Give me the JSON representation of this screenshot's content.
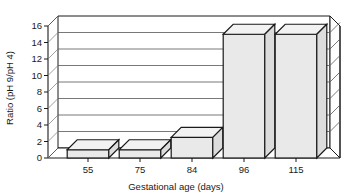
{
  "chart_data": {
    "type": "bar",
    "title": "",
    "subtitle": "",
    "xlabel": "Gestational age (days)",
    "ylabel": "Ratio (pH 9/pH 4)",
    "categories": [
      "55",
      "75",
      "84",
      "96",
      "115"
    ],
    "values": [
      1,
      1,
      2.5,
      15,
      15
    ],
    "series": [
      {
        "name": "Ratio (pH 9/pH 4)",
        "values": [
          1,
          1,
          2.5,
          15,
          15
        ]
      }
    ],
    "ylim": [
      0,
      16
    ],
    "ytick_step": 2,
    "ytick_labels": [
      "0",
      "2",
      "4",
      "6",
      "8",
      "10",
      "12",
      "14",
      "16"
    ],
    "grid": true,
    "grid_axis": "y",
    "legend": false,
    "legend_position": "none",
    "style": "3d-isometric",
    "annotations": [],
    "colors": {
      "bar_face": "#e9e9e9",
      "bar_top": "#f2f2f2",
      "bar_side": "#dcdcdc",
      "outline": "#1a1a1a",
      "gridline": "#555555",
      "wall": "#ffffff",
      "floor": "#ffffff",
      "text": "#1a1a1a"
    }
  }
}
